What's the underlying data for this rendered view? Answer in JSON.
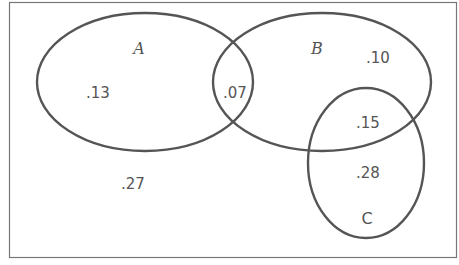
{
  "diagram": {
    "type": "venn",
    "universe": {
      "label_value": ".27"
    },
    "sets": [
      {
        "name": "A",
        "label": "A",
        "italic": true
      },
      {
        "name": "B",
        "label": "B",
        "italic": true
      },
      {
        "name": "C",
        "label": "C",
        "italic": false
      }
    ],
    "regions": {
      "a_only": ".13",
      "a_and_b": ".07",
      "b_only": ".10",
      "b_and_c": ".15",
      "c_only": ".28",
      "outside": ".27"
    },
    "colors": {
      "stroke": "#555555",
      "border": "#777777",
      "background": "#ffffff"
    }
  }
}
